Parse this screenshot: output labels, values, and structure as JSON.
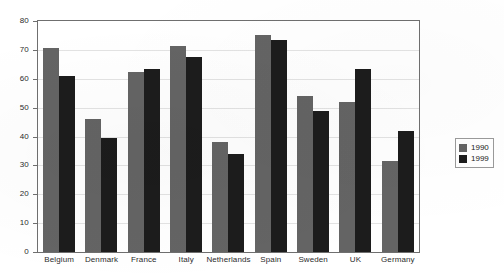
{
  "chart_data": {
    "type": "bar",
    "title": "",
    "subtitle": "",
    "xlabel": "",
    "ylabel": "",
    "ylim": [
      0,
      80
    ],
    "yticks": [
      0,
      10,
      20,
      30,
      40,
      50,
      60,
      70,
      80
    ],
    "grid": true,
    "legend_position": "right",
    "categories": [
      "Belgium",
      "Denmark",
      "France",
      "Italy",
      "Netherlands",
      "Spain",
      "Sweden",
      "UK",
      "Germany"
    ],
    "series": [
      {
        "name": "1990",
        "color": "#646464",
        "values": [
          70.5,
          46,
          62.5,
          71.5,
          38,
          75,
          54,
          52,
          31.5
        ]
      },
      {
        "name": "1999",
        "color": "#1c1c1c",
        "values": [
          61,
          39.5,
          63.5,
          67.5,
          34,
          73.5,
          49,
          63.5,
          42
        ]
      }
    ]
  },
  "legend": {
    "entries": [
      {
        "label": "1990"
      },
      {
        "label": "1999"
      }
    ]
  }
}
